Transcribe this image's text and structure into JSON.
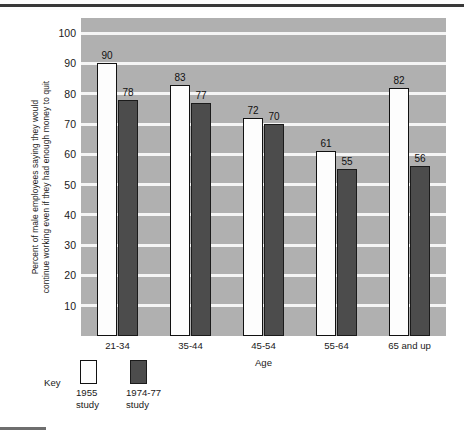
{
  "chart_data": {
    "type": "bar",
    "title": "",
    "subtitle": "",
    "xlabel": "Age",
    "ylabel": "Percent of male employees saying they would continue working even if they had enough money to quit",
    "ylabel_lines": [
      "Percent of male employees saying they would",
      "continue working even if they had enough money to quit"
    ],
    "categories": [
      "21-34",
      "35-44",
      "45-54",
      "55-64",
      "65 and up"
    ],
    "series": [
      {
        "name": "1955 study",
        "values": [
          90,
          83,
          72,
          61,
          82
        ],
        "color": "#fdfdfd"
      },
      {
        "name": "1974-77 study",
        "values": [
          78,
          77,
          70,
          55,
          56
        ],
        "color": "#4c4c4c"
      }
    ],
    "ylim": [
      0,
      105
    ],
    "yticks": [
      10,
      20,
      30,
      40,
      50,
      60,
      70,
      80,
      90,
      100
    ],
    "ytick_labels": [
      "10",
      "20",
      "30",
      "40",
      "50",
      "60",
      "70",
      "80",
      "90",
      "100"
    ],
    "grid": true,
    "grid_color": "#f5f5f5",
    "plot_background": "#b0b0b0",
    "legend_position": "below-left",
    "data_labels": true
  },
  "legend": {
    "key_label": "Key",
    "entries": [
      {
        "line1": "1955",
        "line2": "study"
      },
      {
        "line1": "1974-77",
        "line2": "study"
      }
    ]
  }
}
